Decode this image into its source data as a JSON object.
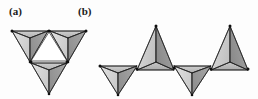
{
  "figure": {
    "background_color": "#fdfdfd",
    "panels": [
      {
        "id": "a",
        "label": "(a)",
        "description": "triangular cluster of three corner-sharing tetrahedra with white central triangle",
        "tetrahedra_count": 3,
        "orientations": [
          "down",
          "down",
          "down"
        ],
        "central_void": "triangle"
      },
      {
        "id": "b",
        "label": "(b)",
        "description": "zigzag chain of four corner-sharing tetrahedra alternating orientation",
        "tetrahedra_count": 4,
        "orientations": [
          "down",
          "up",
          "down",
          "up"
        ]
      }
    ]
  },
  "colors": {
    "face_light": "#d6d6d6",
    "face_medium": "#b8b8b8",
    "face_dark": "#9a9a9a",
    "face_top": "#c4c4c4",
    "edge": "#1c1c1c",
    "vertex": "#101010",
    "void": "#ffffff",
    "label_text": "#1a1a1a",
    "background": "#fdfdfd"
  },
  "geometry": {
    "panel_a": {
      "tet_down_left": {
        "top_left": [
          12,
          31
        ],
        "top_right": [
          48,
          31
        ],
        "apex": [
          30,
          62
        ],
        "back": [
          30,
          38
        ]
      },
      "tet_down_right": {
        "top_left": [
          50,
          31
        ],
        "top_right": [
          86,
          31
        ],
        "apex": [
          68,
          62
        ],
        "back": [
          68,
          38
        ]
      },
      "tet_down_bottom": {
        "top_left": [
          31,
          63
        ],
        "top_right": [
          67,
          63
        ],
        "apex": [
          49,
          94
        ],
        "back": [
          49,
          70
        ]
      },
      "void_triangle": [
        [
          49,
          31
        ],
        [
          31,
          62
        ],
        [
          67,
          62
        ]
      ]
    },
    "panel_b": {
      "baseline_y": 70,
      "tet_1_down": {
        "top_left": [
          100,
          66
        ],
        "top_right": [
          137,
          66
        ],
        "apex": [
          118,
          95
        ],
        "back": [
          118,
          73
        ]
      },
      "tet_2_up": {
        "base_left": [
          137,
          70
        ],
        "base_right": [
          174,
          70
        ],
        "apex": [
          156,
          26
        ],
        "front": [
          156,
          62
        ]
      },
      "tet_3_down": {
        "top_left": [
          174,
          66
        ],
        "top_right": [
          211,
          66
        ],
        "apex": [
          192,
          95
        ],
        "back": [
          192,
          73
        ]
      },
      "tet_4_up": {
        "base_left": [
          211,
          70
        ],
        "base_right": [
          248,
          70
        ],
        "apex": [
          230,
          26
        ],
        "front": [
          230,
          62
        ]
      }
    }
  }
}
